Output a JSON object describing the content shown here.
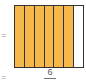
{
  "diagram": {
    "type": "fraction-grid",
    "columns": 7,
    "shaded": 6,
    "shade_color": "#F7B84B",
    "empty_color": "#FFFFFF",
    "border_color": "#333333"
  },
  "labels": {
    "equals_top": "=",
    "equals_bottom": "=",
    "numerator": "6"
  }
}
